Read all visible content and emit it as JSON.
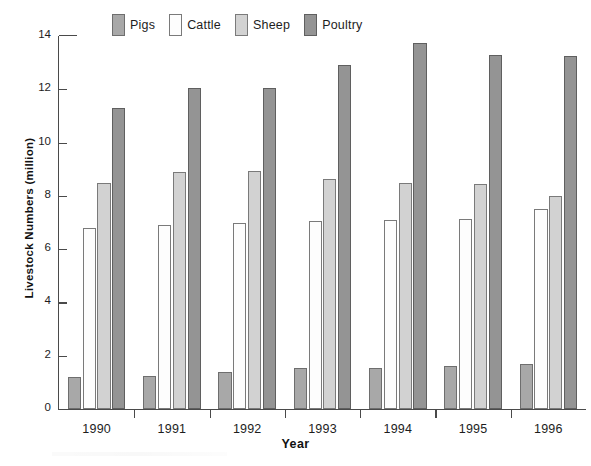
{
  "chart_data": {
    "type": "bar",
    "title": "",
    "xlabel": "Year",
    "ylabel": "Livestock Numbers (million)",
    "categories": [
      "1990",
      "1991",
      "1992",
      "1993",
      "1994",
      "1995",
      "1996"
    ],
    "series": [
      {
        "name": "Pigs",
        "color": "#a8a8a8",
        "values": [
          1.2,
          1.25,
          1.4,
          1.55,
          1.55,
          1.6,
          1.7
        ]
      },
      {
        "name": "Cattle",
        "color": "#fdfdfd",
        "values": [
          6.8,
          6.9,
          7.0,
          7.05,
          7.1,
          7.15,
          7.5
        ]
      },
      {
        "name": "Sheep",
        "color": "#d2d2d2",
        "values": [
          8.5,
          8.9,
          8.95,
          8.65,
          8.5,
          8.45,
          8.0
        ]
      },
      {
        "name": "Poultry",
        "color": "#949494",
        "values": [
          11.3,
          12.05,
          12.05,
          12.9,
          13.75,
          13.3,
          13.25
        ]
      }
    ],
    "ylim": [
      0,
      14
    ],
    "yticks": [
      0,
      2,
      4,
      6,
      8,
      10,
      12,
      14
    ],
    "ytick_labels": [
      "0",
      "2",
      "4",
      "6",
      "8",
      "10",
      "12",
      "14"
    ],
    "grid": false,
    "legend_position": "top"
  },
  "legend": {
    "items": [
      {
        "label": "Pigs",
        "swatch": "pigs-swatch"
      },
      {
        "label": "Cattle",
        "swatch": "cattle-swatch"
      },
      {
        "label": "Sheep",
        "swatch": "sheep-swatch"
      },
      {
        "label": "Poultry",
        "swatch": "poultry-swatch"
      }
    ]
  },
  "axes": {
    "x_title": "Year",
    "y_title": "Livestock Numbers (million)"
  }
}
